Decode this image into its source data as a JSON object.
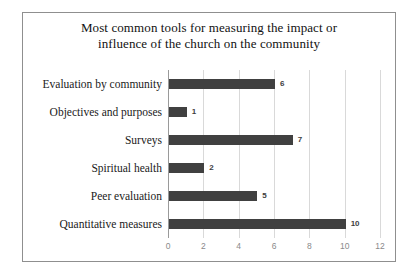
{
  "chart_data": {
    "type": "bar",
    "orientation": "horizontal",
    "title": "Most common tools for measuring the impact or influence of the church on the community",
    "title_lines": [
      "Most common tools for measuring the impact or",
      "influence of the church on the community"
    ],
    "categories": [
      "Evaluation by community",
      "Objectives and purposes",
      "Surveys",
      "Spiritual health",
      "Peer evaluation",
      "Quantitative measures"
    ],
    "values": [
      6,
      1,
      7,
      2,
      5,
      10
    ],
    "data_labels": [
      "6",
      "1",
      "7",
      "2",
      "5",
      "10"
    ],
    "xlabel": "",
    "ylabel": "",
    "xlim": [
      0,
      12
    ],
    "xticks": [
      0,
      2,
      4,
      6,
      8,
      10,
      12
    ],
    "xtick_labels": [
      "0",
      "2",
      "4",
      "6",
      "8",
      "10",
      "12"
    ],
    "grid": "vertical",
    "legend": "none",
    "bar_color": "#404040",
    "gridline_color": "#d9d9d9",
    "axis_color": "#9a9a9a",
    "border_color": "#8f8f8f",
    "background_color": "#ffffff"
  }
}
